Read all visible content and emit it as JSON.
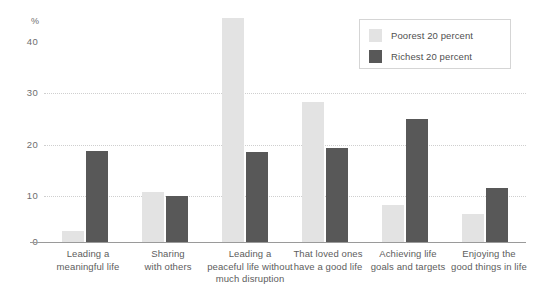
{
  "chart_data": {
    "type": "bar",
    "title": "",
    "xlabel": "",
    "ylabel": "%",
    "ylim": [
      0,
      45
    ],
    "yticks": [
      0,
      10,
      20,
      30,
      40
    ],
    "grid": true,
    "legend_position": "top-right",
    "categories": [
      "Leading a meaningful life",
      "Sharing with others",
      "Leading a peaceful life without much disruption",
      "That loved ones have a good life",
      "Achieving life goals and targets",
      "Enjoying the good things in life"
    ],
    "category_lines": [
      [
        "Leading a",
        "meaningful life"
      ],
      [
        "Sharing",
        "with others"
      ],
      [
        "Leading a",
        "peaceful life without",
        "much disruption"
      ],
      [
        "That loved ones",
        "have a good life"
      ],
      [
        "Achieving life",
        "goals and targets"
      ],
      [
        "Enjoying the",
        "good things in life"
      ]
    ],
    "series": [
      {
        "name": "Poorest 20 percent",
        "color": "#e3e3e3",
        "values": [
          2.2,
          10.0,
          44.6,
          27.8,
          7.3,
          5.6
        ]
      },
      {
        "name": "Richest 20 percent",
        "color": "#585858",
        "values": [
          18.2,
          9.2,
          18.0,
          18.8,
          24.5,
          10.7
        ]
      }
    ]
  },
  "axis": {
    "unit_label": "%",
    "tick_40": "40",
    "tick_30": "30",
    "tick_20": "20",
    "tick_10": "10",
    "tick_0": "0"
  },
  "legend": {
    "item_poorest": "Poorest 20 percent",
    "item_richest": "Richest 20 percent"
  }
}
